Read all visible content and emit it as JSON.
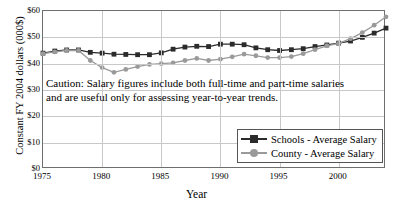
{
  "chart_data": {
    "type": "line",
    "title": "",
    "xlabel": "Year",
    "ylabel": "Constant FY 2004 dollars (000$)",
    "xlim": [
      1975,
      2004
    ],
    "ylim": [
      0,
      60
    ],
    "ytick_labels": [
      "$60",
      "$50",
      "$40",
      "$30",
      "$20",
      "$10",
      "$0"
    ],
    "ytick_values": [
      60,
      50,
      40,
      30,
      20,
      10,
      0
    ],
    "xtick_labels": [
      "1975",
      "1980",
      "1985",
      "1990",
      "1995",
      "2000"
    ],
    "xtick_values": [
      1975,
      1980,
      1985,
      1990,
      1995,
      2000
    ],
    "grid": true,
    "legend_position": "lower right",
    "annotation": {
      "line1": "Caution: Salary figures include both full-time and part-time salaries",
      "line2": "and are useful only for assessing year-to-year trends."
    },
    "x": [
      1975,
      1976,
      1977,
      1978,
      1979,
      1980,
      1981,
      1982,
      1983,
      1984,
      1985,
      1986,
      1987,
      1988,
      1989,
      1990,
      1991,
      1992,
      1993,
      1994,
      1995,
      1996,
      1997,
      1998,
      1999,
      2000,
      2001,
      2002,
      2003,
      2004
    ],
    "series": [
      {
        "name": "Schools - Average Salary",
        "color": "#2b2b2b",
        "marker": "square",
        "values": [
          44.0,
          44.8,
          45.2,
          45.2,
          44.3,
          44.0,
          43.6,
          43.5,
          43.4,
          43.4,
          44.1,
          45.5,
          46.3,
          46.6,
          46.5,
          47.4,
          47.4,
          47.2,
          46.0,
          45.3,
          45.0,
          45.3,
          45.7,
          46.5,
          47.1,
          47.8,
          48.6,
          50.0,
          51.6,
          53.5
        ]
      },
      {
        "name": "County - Average Salary",
        "color": "#9a9a9a",
        "marker": "circle",
        "values": [
          43.8,
          44.5,
          45.0,
          45.0,
          41.2,
          38.5,
          36.7,
          37.8,
          38.9,
          39.7,
          40.0,
          40.3,
          41.2,
          42.0,
          41.2,
          41.7,
          42.6,
          43.6,
          43.0,
          42.3,
          42.3,
          42.7,
          43.8,
          45.3,
          46.8,
          47.7,
          49.5,
          51.8,
          54.6,
          57.8
        ]
      }
    ]
  },
  "legend": {
    "items": [
      {
        "label": "Schools - Average Salary"
      },
      {
        "label": "County - Average Salary"
      }
    ]
  }
}
